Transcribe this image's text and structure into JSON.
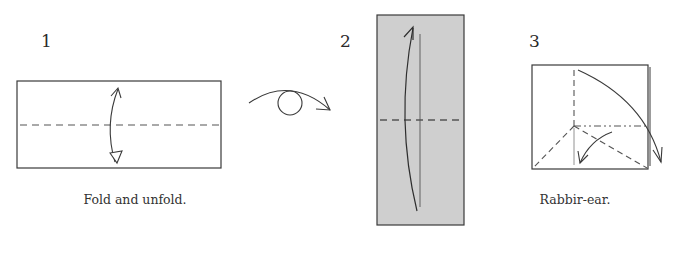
{
  "steps": [
    {
      "number": "1",
      "caption": "Fold and unfold."
    },
    {
      "number": "2",
      "caption": ""
    },
    {
      "number": "3",
      "caption": "Rabbir-ear."
    }
  ],
  "symbols": {
    "turn_over": "turn-over-symbol"
  },
  "colors": {
    "line": "#3a3a3a",
    "paper_white": "#ffffff",
    "paper_gray": "#cfcfcf",
    "dash": "#555555"
  }
}
